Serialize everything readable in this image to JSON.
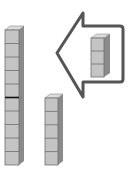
{
  "diagram": {
    "colors": {
      "cube_face": "#c4c4c4",
      "cube_top": "#dcdcdc",
      "cube_side": "#8a8a8a",
      "cube_edge": "#6e6e6e",
      "arrow_outline": "#555555",
      "marker_line": "#111111",
      "background": "#ffffff"
    },
    "stacks": [
      {
        "name": "tall-stack",
        "cube_count": 10,
        "marker_after_cube": 5
      },
      {
        "name": "short-stack",
        "cube_count": 5
      },
      {
        "name": "arrow-stack",
        "cube_count": 3
      }
    ],
    "arrow": {
      "direction": "left"
    }
  }
}
